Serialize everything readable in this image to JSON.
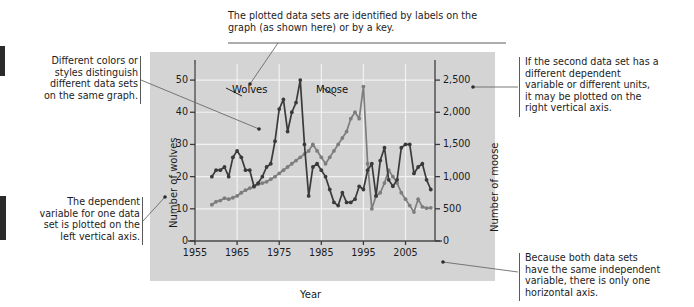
{
  "figure": {
    "panel_bg": "#d4d4d4",
    "notes": [
      {
        "id": "note-labels",
        "align": "left",
        "lines": [
          "The plotted data sets are identified by labels on the",
          "graph (as shown here) or by a key."
        ]
      },
      {
        "id": "note-colors",
        "align": "right",
        "lines": [
          "Different colors or",
          "styles distinguish",
          "different data sets",
          "on the same graph."
        ]
      },
      {
        "id": "note-left-axis",
        "align": "right",
        "lines": [
          "The dependent",
          "variable for one data",
          "set is plotted on the",
          "left vertical axis."
        ]
      },
      {
        "id": "note-right-axis",
        "align": "left",
        "lines": [
          "If the second data set has a",
          "different dependent",
          "variable or different units,",
          "it may be plotted on the",
          "right vertical axis."
        ]
      },
      {
        "id": "note-one-horizontal",
        "align": "left",
        "lines": [
          "Because both data sets",
          "have the same independent",
          "variable, there is only one",
          "horizontal axis."
        ]
      }
    ]
  },
  "chart_data": {
    "type": "line",
    "title": "",
    "xlabel": "Year",
    "ylabel": "Number of wolves",
    "y2label": "Number of moose",
    "xlim": [
      1955,
      2012
    ],
    "ylim": [
      0,
      55
    ],
    "y2lim": [
      0,
      2750
    ],
    "xticks": [
      "1955",
      "1965",
      "1975",
      "1985",
      "1995",
      "2005"
    ],
    "xtick_values": [
      1955,
      1965,
      1975,
      1985,
      1995,
      2005
    ],
    "yticks": [
      "0",
      "10",
      "20",
      "30",
      "40",
      "50"
    ],
    "ytick_values": [
      0,
      10,
      20,
      30,
      40,
      50
    ],
    "y2ticks": [
      "0",
      "500",
      "1,000",
      "1,500",
      "2,000",
      "2,500"
    ],
    "y2tick_values": [
      0,
      500,
      1000,
      1500,
      2000,
      2500
    ],
    "grid": true,
    "legend": "inline-labels",
    "annotations": [
      {
        "text": "Wolves",
        "x": 1968,
        "y": 43
      },
      {
        "text": "Moose",
        "x": 1987,
        "y": 43
      }
    ],
    "series": [
      {
        "name": "Wolves",
        "axis": "left",
        "color": "#3a3a3a",
        "x": [
          1959,
          1960,
          1961,
          1962,
          1963,
          1964,
          1965,
          1966,
          1967,
          1968,
          1969,
          1970,
          1971,
          1972,
          1973,
          1974,
          1975,
          1976,
          1977,
          1978,
          1979,
          1980,
          1981,
          1982,
          1983,
          1984,
          1985,
          1986,
          1987,
          1988,
          1989,
          1990,
          1991,
          1992,
          1993,
          1994,
          1995,
          1996,
          1997,
          1998,
          1999,
          2000,
          2001,
          2002,
          2003,
          2004,
          2005,
          2006,
          2007,
          2008,
          2009,
          2010,
          2011
        ],
        "values": [
          20,
          22,
          22,
          23,
          20,
          26,
          28,
          26,
          22,
          22,
          17,
          18,
          20,
          23,
          24,
          31,
          41,
          44,
          34,
          40,
          43,
          50,
          30,
          14,
          23,
          24,
          22,
          20,
          16,
          12,
          11,
          15,
          12,
          12,
          13,
          17,
          16,
          22,
          24,
          14,
          25,
          29,
          19,
          17,
          19,
          29,
          30,
          30,
          21,
          23,
          24,
          19,
          16
        ]
      },
      {
        "name": "Moose",
        "axis": "right",
        "color": "#7d7d7d",
        "x": [
          1959,
          1960,
          1961,
          1962,
          1963,
          1964,
          1965,
          1966,
          1967,
          1968,
          1969,
          1970,
          1971,
          1972,
          1973,
          1974,
          1975,
          1976,
          1977,
          1978,
          1979,
          1980,
          1981,
          1982,
          1983,
          1984,
          1985,
          1986,
          1987,
          1988,
          1989,
          1990,
          1991,
          1992,
          1993,
          1994,
          1995,
          1996,
          1997,
          1998,
          1999,
          2000,
          2001,
          2002,
          2003,
          2004,
          2005,
          2006,
          2007,
          2008,
          2009,
          2010,
          2011
        ],
        "values": [
          563,
          610,
          628,
          665,
          650,
          672,
          700,
          750,
          790,
          820,
          840,
          880,
          900,
          920,
          960,
          1000,
          1050,
          1100,
          1150,
          1200,
          1250,
          1300,
          1350,
          1400,
          1500,
          1400,
          1300,
          1200,
          1300,
          1400,
          1500,
          1600,
          1700,
          1900,
          2000,
          1900,
          2400,
          1200,
          500,
          700,
          750,
          900,
          1100,
          1000,
          900,
          750,
          650,
          550,
          450,
          650,
          530,
          510,
          515
        ]
      }
    ]
  }
}
